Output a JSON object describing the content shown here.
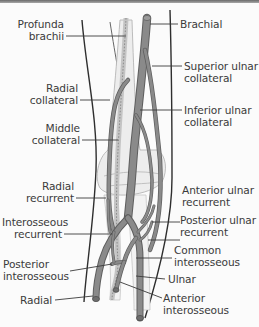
{
  "figure": {
    "colors": {
      "artery": "#8a8a8a",
      "artery_edge": "#5e5e5e",
      "bone": "#ededed",
      "bone_edge": "#b5b5b5",
      "nerve_dashed": "#c4c4c4",
      "outline": "#2e2e2e",
      "leader": "#3a3a3a",
      "text": "#3a3a3a",
      "background": "#fbfbfb"
    }
  },
  "labels": {
    "left": [
      {
        "id": "profunda-brachii",
        "lines": [
          "Profunda",
          "brachii"
        ]
      },
      {
        "id": "radial-collateral",
        "lines": [
          "Radial",
          "collateral"
        ]
      },
      {
        "id": "middle-collateral",
        "lines": [
          "Middle",
          "collateral"
        ]
      },
      {
        "id": "radial-recurrent",
        "lines": [
          "Radial",
          "recurrent"
        ]
      },
      {
        "id": "interosseous-recurrent",
        "lines": [
          "Interosseous",
          "recurrent"
        ]
      },
      {
        "id": "posterior-interosseous",
        "lines": [
          "Posterior",
          "interosseous"
        ]
      },
      {
        "id": "radial",
        "lines": [
          "Radial"
        ]
      }
    ],
    "right": [
      {
        "id": "brachial",
        "lines": [
          "Brachial"
        ]
      },
      {
        "id": "superior-ulnar-collateral",
        "lines": [
          "Superior ulnar",
          "collateral"
        ]
      },
      {
        "id": "inferior-ulnar-collateral",
        "lines": [
          "Inferior ulnar",
          "collateral"
        ]
      },
      {
        "id": "anterior-ulnar-recurrent",
        "lines": [
          "Anterior ulnar",
          "recurrent"
        ]
      },
      {
        "id": "posterior-ulnar-recurrent",
        "lines": [
          "Posterior ulnar",
          "recurrent"
        ]
      },
      {
        "id": "common-interosseous",
        "lines": [
          "Common",
          "interosseous"
        ]
      },
      {
        "id": "ulnar",
        "lines": [
          "Ulnar"
        ]
      },
      {
        "id": "anterior-interosseous",
        "lines": [
          "Anterior",
          "interosseous"
        ]
      }
    ]
  }
}
